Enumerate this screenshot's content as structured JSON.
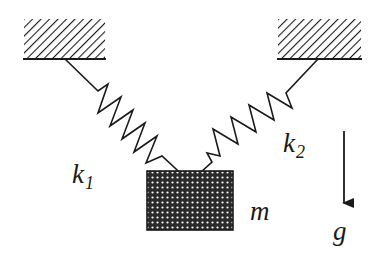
{
  "diagram": {
    "type": "spring-mass system",
    "labels": {
      "spring_left": "k",
      "spring_left_sub": "1",
      "spring_right": "k",
      "spring_right_sub": "2",
      "mass": "m",
      "gravity": "g"
    },
    "colors": {
      "stroke": "#1a1a1a",
      "background": "#ffffff"
    }
  }
}
